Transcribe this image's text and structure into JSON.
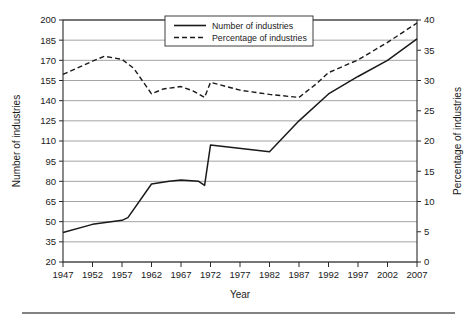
{
  "chart_data": {
    "type": "line",
    "title": "",
    "xlabel": "Year",
    "ylabel": "Number of industries",
    "y2label": "Percentage of industries",
    "grid": true,
    "legend_position": "top-center",
    "x": [
      1947,
      1952,
      1957,
      1962,
      1967,
      1972,
      1977,
      1982,
      1987,
      1992,
      1997,
      2002,
      2007
    ],
    "xtick_labels": [
      "1947",
      "1952",
      "1957",
      "1962",
      "1967",
      "1972",
      "1977",
      "1982",
      "1987",
      "1992",
      "1997",
      "2002",
      "2007"
    ],
    "xlim": [
      1947,
      2007
    ],
    "ylim": [
      20,
      200
    ],
    "ytick_values": [
      20,
      35,
      50,
      65,
      80,
      95,
      110,
      125,
      140,
      155,
      170,
      185,
      200
    ],
    "ytick_labels": [
      "20",
      "35",
      "50",
      "65",
      "80",
      "95",
      "110",
      "125",
      "140",
      "155",
      "170",
      "185",
      "200"
    ],
    "y2lim": [
      0,
      40
    ],
    "y2tick_values": [
      0,
      5,
      10,
      15,
      20,
      25,
      30,
      35,
      40
    ],
    "y2tick_labels": [
      "0",
      "5",
      "10",
      "15",
      "20",
      "25",
      "30",
      "35",
      "40"
    ],
    "series": [
      {
        "name": "Number of industries",
        "axis": "left",
        "style": "solid",
        "x": [
          1947,
          1952,
          1957,
          1958,
          1962,
          1965,
          1967,
          1970,
          1971,
          1972,
          1982,
          1987,
          1992,
          1997,
          2002,
          2007
        ],
        "values": [
          42,
          48,
          51,
          53,
          78,
          80,
          81,
          80,
          77,
          107,
          102,
          125,
          145,
          158,
          170,
          186
        ]
      },
      {
        "name": "Percentage of industries",
        "axis": "right",
        "style": "dashed",
        "x": [
          1947,
          1952,
          1954,
          1957,
          1959,
          1962,
          1964,
          1967,
          1969,
          1971,
          1972,
          1977,
          1982,
          1987,
          1990,
          1992,
          1997,
          2002,
          2007
        ],
        "values": [
          31.0,
          33.2,
          34.0,
          33.5,
          32.0,
          27.8,
          28.6,
          29.0,
          28.3,
          27.2,
          29.7,
          28.4,
          27.7,
          27.2,
          29.5,
          31.3,
          33.4,
          36.3,
          39.5
        ]
      }
    ],
    "legend_entries": [
      {
        "label": "Number of industries",
        "style": "solid"
      },
      {
        "label": "Percentage of industries",
        "style": "dashed"
      }
    ]
  }
}
